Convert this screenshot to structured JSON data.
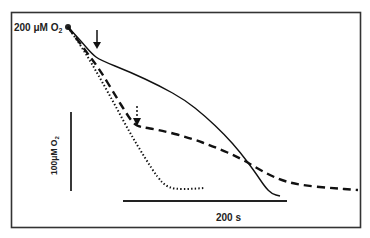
{
  "chart_data": {
    "type": "line",
    "title": "",
    "xlabel": "",
    "ylabel": "",
    "start_label": "200 μM O",
    "start_label_subscript": "2",
    "scale_bars": {
      "vertical": {
        "label": "100μM O",
        "label_subscript": "2",
        "value": 100,
        "unit": "μM O2"
      },
      "horizontal": {
        "label": "200 s",
        "value": 200,
        "unit": "s"
      }
    },
    "grid": false,
    "legend": null,
    "series": [
      {
        "name": "solid",
        "style": "solid",
        "points_px": [
          [
            68,
            27
          ],
          [
            80,
            40
          ],
          [
            92,
            54
          ],
          [
            100,
            60
          ],
          [
            130,
            72
          ],
          [
            160,
            86
          ],
          [
            185,
            100
          ],
          [
            205,
            116
          ],
          [
            225,
            135
          ],
          [
            240,
            152
          ],
          [
            255,
            172
          ],
          [
            265,
            187
          ],
          [
            272,
            194
          ],
          [
            280,
            196
          ]
        ]
      },
      {
        "name": "dashed",
        "style": "dashed",
        "points_px": [
          [
            68,
            27
          ],
          [
            85,
            50
          ],
          [
            100,
            70
          ],
          [
            115,
            95
          ],
          [
            128,
            116
          ],
          [
            134,
            124
          ],
          [
            140,
            127
          ],
          [
            160,
            130
          ],
          [
            190,
            138
          ],
          [
            215,
            147
          ],
          [
            240,
            158
          ],
          [
            260,
            170
          ],
          [
            280,
            180
          ],
          [
            300,
            185
          ],
          [
            330,
            188
          ],
          [
            358,
            190
          ]
        ]
      },
      {
        "name": "dotted",
        "style": "dotted",
        "points_px": [
          [
            68,
            27
          ],
          [
            85,
            52
          ],
          [
            100,
            78
          ],
          [
            115,
            105
          ],
          [
            130,
            133
          ],
          [
            145,
            158
          ],
          [
            158,
            178
          ],
          [
            166,
            186
          ],
          [
            175,
            189
          ],
          [
            190,
            189
          ],
          [
            205,
            188
          ]
        ]
      }
    ],
    "annotations": [
      {
        "type": "arrow",
        "style": "solid",
        "points_to": "solid curve inflection",
        "at_px": [
          97,
          57
        ]
      },
      {
        "type": "arrow",
        "style": "dashed",
        "points_to": "dashed curve inflection",
        "at_px": [
          137,
          124
        ]
      }
    ]
  }
}
